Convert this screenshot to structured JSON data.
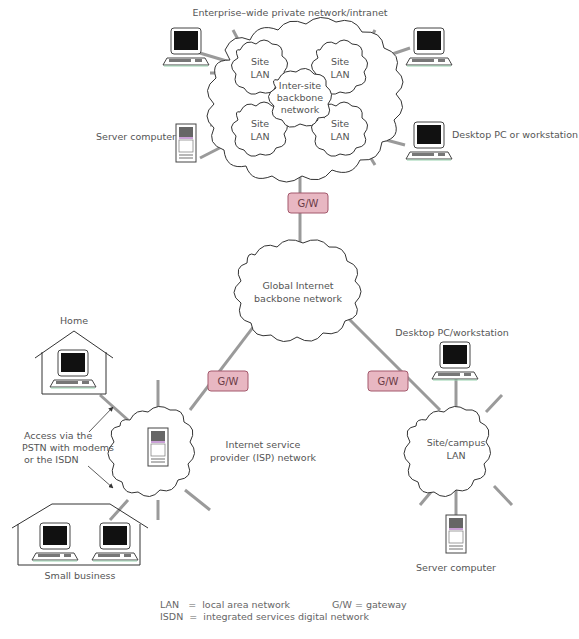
{
  "title": "Enterprise–wide private network/intranet",
  "enterprise": {
    "site_lan_line1": "Site",
    "site_lan_line2": "LAN",
    "backbone_line1": "Inter-site",
    "backbone_line2": "backbone",
    "backbone_line3": "network",
    "server_label": "Server computer",
    "desktop_label": "Desktop PC or workstation"
  },
  "gateways": {
    "label": "G/W",
    "color_fill": "#e8b7c2",
    "color_stroke": "#a3596c"
  },
  "internet": {
    "line1": "Global Internet",
    "line2": "backbone network"
  },
  "isp": {
    "line1": "Internet service",
    "line2": "provider (ISP) network",
    "home_label": "Home",
    "small_business_label": "Small business",
    "access_line1": "Access via the",
    "access_line2": "PSTN with modems",
    "access_line3": "or the ISDN"
  },
  "campus": {
    "line1": "Site/campus",
    "line2": "LAN",
    "desktop_label": "Desktop PC/workstation",
    "server_label": "Server computer"
  },
  "legend": {
    "lan": "LAN   =  local area network",
    "isdn": "ISDN  =  integrated services digital network",
    "gw": "G/W = gateway"
  }
}
